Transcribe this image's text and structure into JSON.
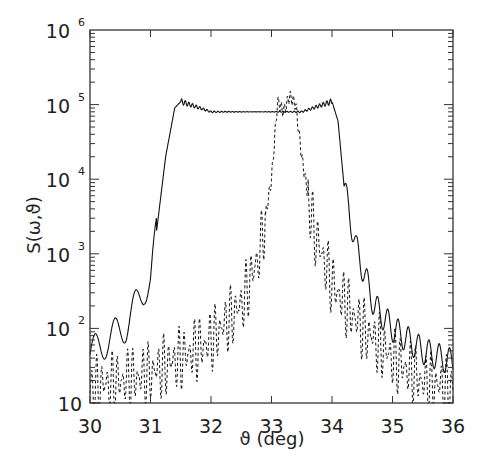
{
  "chart_data": {
    "type": "line",
    "title": "",
    "xlabel": "ϑ (deg)",
    "ylabel": "S(ω,ϑ)",
    "xlim": [
      30,
      36
    ],
    "ylim": [
      10,
      1000000
    ],
    "yscale": "log",
    "x_ticks": [
      "30",
      "31",
      "32",
      "33",
      "34",
      "35",
      "36"
    ],
    "y_ticks": [
      {
        "base": "10",
        "exp": "6"
      },
      {
        "base": "10",
        "exp": "5"
      },
      {
        "base": "10",
        "exp": "4"
      },
      {
        "base": "10",
        "exp": "3"
      },
      {
        "base": "10",
        "exp": "2"
      },
      {
        "base": "10",
        "exp": ""
      }
    ],
    "grid": false,
    "legend": null,
    "series": [
      {
        "name": "solid",
        "style": "solid",
        "x": [
          30.0,
          30.3,
          30.6,
          30.9,
          31.0,
          31.1,
          31.25,
          31.4,
          31.5,
          32.0,
          32.5,
          33.0,
          33.5,
          34.0,
          34.1,
          34.2,
          34.4,
          34.7,
          35.0,
          35.5,
          36.0
        ],
        "y": [
          45,
          70,
          110,
          350,
          420,
          2000,
          20000,
          90000,
          110000,
          80000,
          80000,
          80000,
          80000,
          110000,
          60000,
          8000,
          1200,
          200,
          100,
          50,
          35
        ]
      },
      {
        "name": "dashed",
        "style": "dashed",
        "x": [
          30.0,
          30.5,
          31.0,
          31.5,
          32.0,
          32.5,
          32.8,
          33.0,
          33.1,
          33.2,
          33.3,
          33.4,
          33.5,
          33.7,
          34.0,
          34.5,
          35.0,
          35.5,
          36.0
        ],
        "y": [
          15,
          20,
          25,
          40,
          70,
          200,
          1000,
          10000,
          110000,
          80000,
          130000,
          100000,
          20000,
          2000,
          400,
          100,
          40,
          20,
          15
        ]
      }
    ]
  }
}
